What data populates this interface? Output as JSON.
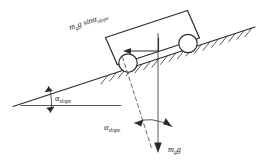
{
  "figure": {
    "background_color": "#ffffff",
    "line_color": "#2b2b2b",
    "dashed_line_color": "#5a5a5a"
  },
  "labels": {
    "gravity_component": {
      "base": "m",
      "base_sub": "g",
      "mid": "g sin",
      "angle_symbol": "α",
      "angle_sub": "slope",
      "full_text": "m_g g sinα_slope",
      "rotation_deg": -18
    },
    "weight": {
      "base": "m",
      "base_sub": "g",
      "mid": "g",
      "full_text": "m_g g",
      "rotation_deg": 0
    },
    "angle_lower_left": {
      "angle_symbol": "α",
      "angle_sub": "slope",
      "full_text": "α_slope"
    },
    "angle_bottom_center": {
      "angle_symbol": "α",
      "angle_sub": "slope",
      "full_text": "α_slope"
    }
  },
  "elements": {
    "incline_surface": "inclined ground line with hatching",
    "horizontal_reference": "horizontal dashed-free reference line",
    "wagon_body": "rectangular wagon box tilted along the slope",
    "wheel_front": "left circular wheel",
    "wheel_rear": "right circular wheel",
    "slope_force_arrow": "arrow pointing up-slope inside wagon",
    "weight_arrow": "vertical downward gravity arrow",
    "normal_dashed_line": "dashed line perpendicular to incline",
    "angle_arc_lower_left": "double arrow arc at slope/horizontal intersection",
    "angle_arc_bottom": "double arrow arc between dashed normal and vertical"
  }
}
